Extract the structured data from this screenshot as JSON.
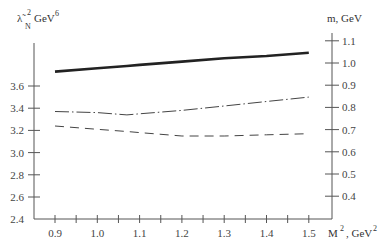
{
  "chart_data": {
    "type": "line",
    "title": "",
    "xlabel": "M², GeV²",
    "xlabel_base": "M",
    "xlabel_sup": "2",
    "xlabel_unit": ", GeV",
    "xlabel_unit_sup": "2",
    "ylabel_left": "λ̃_N² GeV⁶",
    "ylabel_left_parts": {
      "symbol": "λ̃",
      "sub": "N",
      "sup": "2",
      "unit": "GeV",
      "unit_sup": "6"
    },
    "ylabel_right": "m, GeV",
    "xlim": [
      0.9,
      1.5
    ],
    "ylim_left": [
      2.4,
      3.8
    ],
    "ylim_right": [
      0.35,
      1.15
    ],
    "x_ticks": [
      0.9,
      1.0,
      1.1,
      1.2,
      1.3,
      1.4,
      1.5
    ],
    "x_tick_labels": [
      "0.9",
      "1.0",
      "1.1",
      "1.2",
      "1.3",
      "1.4",
      "1.5"
    ],
    "x_minor_ticks": [
      0.95,
      1.05,
      1.15,
      1.25,
      1.35,
      1.45
    ],
    "y_left_ticks": [
      2.4,
      2.6,
      2.8,
      3.0,
      3.2,
      3.4,
      3.6
    ],
    "y_left_tick_labels": [
      "2.4",
      "2.6",
      "2.8",
      "3.0",
      "3.2",
      "3.4",
      "3.6"
    ],
    "y_right_ticks": [
      0.4,
      0.5,
      0.6,
      0.7,
      0.8,
      0.9,
      1.0,
      1.1
    ],
    "y_right_tick_labels": [
      "0.4",
      "0.5",
      "0.6",
      "0.7",
      "0.8",
      "0.9",
      "1.0",
      "1.1"
    ],
    "grid": false,
    "legend": null,
    "x": [
      0.9,
      1.0,
      1.07,
      1.1,
      1.2,
      1.3,
      1.4,
      1.5
    ],
    "series": [
      {
        "name": "solid (thick)",
        "style": "solid",
        "axis": "left",
        "values": [
          3.73,
          3.76,
          3.78,
          3.79,
          3.82,
          3.85,
          3.87,
          3.9
        ]
      },
      {
        "name": "dash-dot",
        "style": "dashdot",
        "axis": "left",
        "values": [
          3.37,
          3.36,
          3.34,
          3.35,
          3.38,
          3.42,
          3.46,
          3.5
        ]
      },
      {
        "name": "dashed",
        "style": "dashed",
        "axis": "left",
        "values": [
          3.24,
          3.21,
          3.19,
          3.18,
          3.15,
          3.15,
          3.16,
          3.17
        ]
      }
    ]
  }
}
